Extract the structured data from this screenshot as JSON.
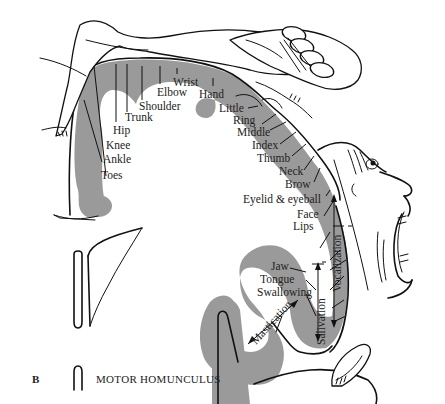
{
  "figure": {
    "panel_label": "B",
    "caption": "MOTOR HOMUNCULUS",
    "colors": {
      "cortex_gray": "#9a9a9a",
      "line": "#111111",
      "background": "#ffffff"
    }
  },
  "body_parts": [
    {
      "id": "toes",
      "label": "Toes"
    },
    {
      "id": "ankle",
      "label": "Ankle"
    },
    {
      "id": "knee",
      "label": "Knee"
    },
    {
      "id": "hip",
      "label": "Hip"
    },
    {
      "id": "trunk",
      "label": "Trunk"
    },
    {
      "id": "shoulder",
      "label": "Shoulder"
    },
    {
      "id": "elbow",
      "label": "Elbow"
    },
    {
      "id": "wrist",
      "label": "Wrist"
    },
    {
      "id": "hand",
      "label": "Hand"
    },
    {
      "id": "little",
      "label": "Little"
    },
    {
      "id": "ring",
      "label": "Ring"
    },
    {
      "id": "middle",
      "label": "Middle"
    },
    {
      "id": "index",
      "label": "Index"
    },
    {
      "id": "thumb",
      "label": "Thumb"
    },
    {
      "id": "neck",
      "label": "Neck"
    },
    {
      "id": "brow",
      "label": "Brow"
    },
    {
      "id": "eyelid",
      "label": "Eyelid & eyeball"
    },
    {
      "id": "face",
      "label": "Face"
    },
    {
      "id": "lips",
      "label": "Lips"
    },
    {
      "id": "jaw",
      "label": "Jaw"
    },
    {
      "id": "tongue",
      "label": "Tongue"
    },
    {
      "id": "swallowing",
      "label": "Swallowing"
    }
  ],
  "functions": [
    {
      "id": "vocalization",
      "label": "Vocalization"
    },
    {
      "id": "salivation",
      "label": "Salivation"
    },
    {
      "id": "mastication",
      "label": "Mastication"
    }
  ],
  "illustrations": [
    {
      "id": "homunculus-body",
      "description": "reclining figure with leg, torso and large hand over cortex"
    },
    {
      "id": "homunculus-face",
      "description": "large face with open mouth and eye"
    },
    {
      "id": "homunculus-tongue",
      "description": "tongue"
    },
    {
      "id": "orientation-sketch",
      "description": "small hemisphere section outline"
    }
  ]
}
